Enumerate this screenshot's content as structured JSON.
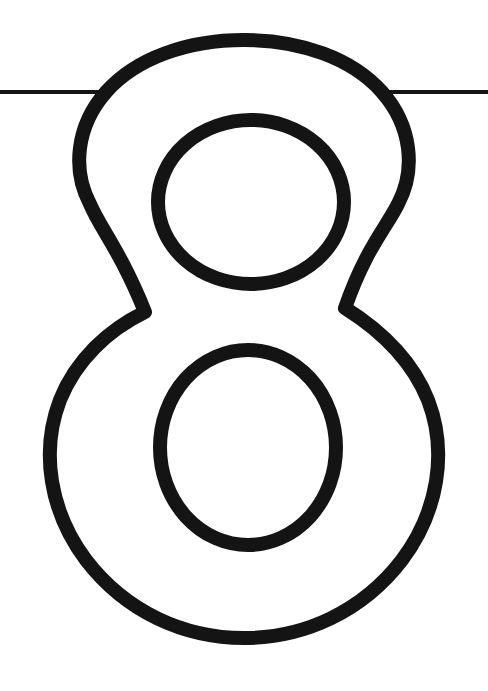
{
  "page": {
    "background_color": "#ffffff",
    "width": 488,
    "height": 691
  },
  "artwork": {
    "name": "outlined-numeral-eight",
    "description": "Large hollow outline of the digit eight, drawn as a black contour on a white field, as found on a printable coloring worksheet.",
    "character": "8",
    "ink_color": "#141414",
    "fill_color": "#ffffff",
    "stroke_width_px": 14,
    "style": "outline",
    "bounds": {
      "left": 45,
      "top": 33,
      "right": 440,
      "bottom": 645
    },
    "parts": [
      {
        "name": "upper-bowl",
        "left": 68,
        "right": 415,
        "top": 33,
        "bottom": 312
      },
      {
        "name": "upper-counter",
        "shape": "circle",
        "left": 158,
        "right": 344,
        "top": 120,
        "bottom": 284
      },
      {
        "name": "waist-cusp-left",
        "x": 145,
        "y": 312
      },
      {
        "name": "waist-cusp-right",
        "x": 345,
        "y": 308
      },
      {
        "name": "lower-bowl",
        "left": 45,
        "right": 440,
        "top": 308,
        "bottom": 645
      },
      {
        "name": "lower-counter",
        "shape": "oval",
        "left": 160,
        "right": 336,
        "top": 350,
        "bottom": 545
      }
    ]
  },
  "guide_line": {
    "name": "horizontal-rule",
    "description": "Thin horizontal line crossing the full width of the sheet behind the numeral.",
    "y": 92,
    "thickness_px": 4,
    "x_start": 0,
    "x_end": 488,
    "color": "#141414"
  }
}
